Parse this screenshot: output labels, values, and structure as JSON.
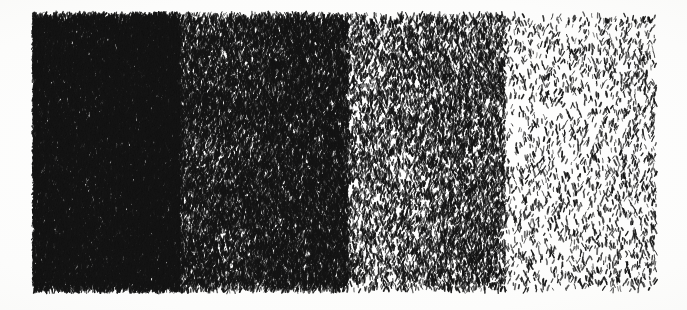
{
  "artwork": {
    "title": "Ink Stroke Density Gradient Study",
    "medium": "pen and ink on paper",
    "technique": "short-dash hatching",
    "orientation": "landscape",
    "panel_count": 4
  },
  "canvas": {
    "width": 687,
    "height": 310,
    "background_color": "#fdfdfc",
    "paper_tint": "#f7f7f5",
    "ink_color": "#141414"
  },
  "drawing_bounds": {
    "left": 33,
    "top": 14,
    "right": 656,
    "bottom": 291,
    "width": 623,
    "height": 277
  },
  "stroke_style": {
    "shape": "tapered-dash",
    "min_length": 2.2,
    "max_length": 6.0,
    "min_width": 0.7,
    "max_width": 1.9,
    "base_angle_deg": -80,
    "angle_jitter_deg": 34,
    "ink_color": "#141414",
    "opacity_min": 0.62,
    "opacity_max": 1.0
  },
  "panels": [
    {
      "index": 1,
      "name": "panel-darkest",
      "tone_label": "near-black",
      "x_start": 33,
      "x_end": 180,
      "width": 147,
      "density": 1.0,
      "stroke_count": 14200,
      "coverage_percent": 88,
      "edge_dark_bias": 0.12
    },
    {
      "index": 2,
      "name": "panel-dark-mid",
      "tone_label": "dark middle tone",
      "x_start": 180,
      "x_end": 348,
      "width": 168,
      "density": 0.62,
      "stroke_count": 9600,
      "coverage_percent": 58,
      "edge_dark_bias": 0.3
    },
    {
      "index": 3,
      "name": "panel-light-mid",
      "tone_label": "light middle tone",
      "x_start": 348,
      "x_end": 505,
      "width": 157,
      "density": 0.3,
      "stroke_count": 4400,
      "coverage_percent": 28,
      "edge_dark_bias": 0.34
    },
    {
      "index": 4,
      "name": "panel-lightest",
      "tone_label": "sparse / near-white",
      "x_start": 505,
      "x_end": 656,
      "width": 151,
      "density": 0.085,
      "stroke_count": 1150,
      "coverage_percent": 8,
      "edge_dark_bias": 0.18
    }
  ],
  "edges": {
    "top_ragged": true,
    "bottom_ragged": true,
    "top_band_height": 5,
    "bottom_band_height": 6,
    "note": "stroke ends feather irregularly along top and bottom margins"
  },
  "chart_data": {
    "type": "bar",
    "xlabel": "Panel",
    "ylabel": "Tonal coverage (%)",
    "categories": [
      "Panel 1",
      "Panel 2",
      "Panel 3",
      "Panel 4"
    ],
    "values": [
      88,
      58,
      28,
      8
    ],
    "series": [
      {
        "name": "coverage_percent",
        "values": [
          88,
          58,
          28,
          8
        ]
      },
      {
        "name": "stroke_count",
        "values": [
          14200,
          9600,
          4400,
          1150
        ]
      },
      {
        "name": "relative_density",
        "values": [
          1.0,
          0.62,
          0.3,
          0.085
        ]
      }
    ],
    "ylim": [
      0,
      100
    ],
    "grid": false,
    "legend": "none"
  }
}
